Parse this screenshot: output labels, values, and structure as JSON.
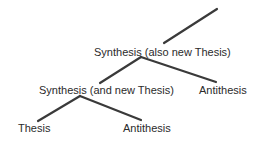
{
  "diagram": {
    "nodes": {
      "top_synthesis": "Synthesis (also new Thesis)",
      "mid_synthesis": "Synthesis (and new Thesis)",
      "mid_antithesis": "Antithesis",
      "thesis": "Thesis",
      "bottom_antithesis": "Antithesis"
    },
    "edges": [
      {
        "from": "top_synthesis",
        "to": "continuation (upward)"
      },
      {
        "from": "top_synthesis",
        "to": "mid_synthesis"
      },
      {
        "from": "top_synthesis",
        "to": "mid_antithesis"
      },
      {
        "from": "mid_synthesis",
        "to": "thesis"
      },
      {
        "from": "mid_synthesis",
        "to": "bottom_antithesis"
      }
    ],
    "line_color": "#3a3a3a",
    "text_color": "#2b2b2b"
  }
}
